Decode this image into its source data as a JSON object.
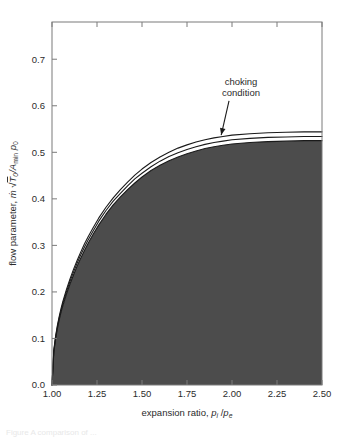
{
  "figure": {
    "background_color": "#ffffff",
    "frame_color": "#7a7a7a",
    "curve_color": "#1a1a1a",
    "fill_color": "#4c4c4c",
    "text_color": "#2b2b2b",
    "partial_caption": "Figure  A  comparison of ..."
  },
  "chart_data": {
    "type": "area",
    "title": "",
    "xlabel_parts": {
      "lead": "expansion ratio, ",
      "num_symbol": "p",
      "num_sub": "i",
      "slash": " /",
      "den_symbol": "p",
      "den_sub": "e"
    },
    "ylabel_parts": {
      "lead": "flow parameter, ",
      "mdot": "ṁ",
      "radical": "√",
      "t_symbol": "T",
      "t_sub": "0",
      "divider": "/A",
      "a_sub": "min",
      "p_symbol": "p",
      "p_sub": "0"
    },
    "xlabel": "expansion ratio, p_i / p_e",
    "ylabel": "flow parameter, ṁ √T_0 / A_min p_0",
    "xlim": [
      1.0,
      2.5
    ],
    "ylim": [
      0.0,
      0.78
    ],
    "xticks": [
      1.0,
      1.25,
      1.5,
      1.75,
      2.0,
      2.25,
      2.5
    ],
    "xtick_labels": [
      "1.00",
      "1.25",
      "1.50",
      "1.75",
      "2.00",
      "2.25",
      "2.50"
    ],
    "yticks": [
      0.0,
      0.1,
      0.2,
      0.3,
      0.4,
      0.5,
      0.6,
      0.7
    ],
    "ytick_labels": [
      "0.0",
      "0.1",
      "0.2",
      "0.3",
      "0.4",
      "0.5",
      "0.6",
      "0.7"
    ],
    "grid": false,
    "legend": null,
    "annotations": [
      {
        "text_line1": "choking",
        "text_line2": "condition",
        "text": "choking condition",
        "x_text": 2.05,
        "y_text": 0.645,
        "x_point": 1.94,
        "y_point": 0.537,
        "arrow": true
      }
    ],
    "series": [
      {
        "name": "upper choking curve",
        "shaded": false,
        "points": [
          [
            1.0,
            0.0
          ],
          [
            1.01,
            0.075
          ],
          [
            1.02,
            0.105
          ],
          [
            1.03,
            0.128
          ],
          [
            1.04,
            0.147
          ],
          [
            1.05,
            0.164
          ],
          [
            1.06,
            0.179
          ],
          [
            1.08,
            0.205
          ],
          [
            1.1,
            0.228
          ],
          [
            1.12,
            0.249
          ],
          [
            1.14,
            0.268
          ],
          [
            1.16,
            0.286
          ],
          [
            1.18,
            0.303
          ],
          [
            1.2,
            0.318
          ],
          [
            1.23,
            0.339
          ],
          [
            1.26,
            0.359
          ],
          [
            1.3,
            0.382
          ],
          [
            1.34,
            0.402
          ],
          [
            1.38,
            0.42
          ],
          [
            1.42,
            0.436
          ],
          [
            1.46,
            0.451
          ],
          [
            1.5,
            0.464
          ],
          [
            1.55,
            0.478
          ],
          [
            1.6,
            0.49
          ],
          [
            1.65,
            0.5
          ],
          [
            1.7,
            0.509
          ],
          [
            1.75,
            0.516
          ],
          [
            1.8,
            0.522
          ],
          [
            1.85,
            0.527
          ],
          [
            1.9,
            0.531
          ],
          [
            1.95,
            0.534
          ],
          [
            2.0,
            0.537
          ],
          [
            2.1,
            0.54
          ],
          [
            2.2,
            0.542
          ],
          [
            2.3,
            0.543
          ],
          [
            2.4,
            0.544
          ],
          [
            2.5,
            0.544
          ]
        ]
      },
      {
        "name": "middle curve",
        "shaded": false,
        "points": [
          [
            1.0,
            0.0
          ],
          [
            1.01,
            0.073
          ],
          [
            1.02,
            0.102
          ],
          [
            1.03,
            0.125
          ],
          [
            1.04,
            0.144
          ],
          [
            1.05,
            0.16
          ],
          [
            1.06,
            0.175
          ],
          [
            1.08,
            0.2
          ],
          [
            1.1,
            0.223
          ],
          [
            1.12,
            0.243
          ],
          [
            1.14,
            0.262
          ],
          [
            1.16,
            0.28
          ],
          [
            1.18,
            0.296
          ],
          [
            1.2,
            0.311
          ],
          [
            1.23,
            0.332
          ],
          [
            1.26,
            0.352
          ],
          [
            1.3,
            0.375
          ],
          [
            1.34,
            0.395
          ],
          [
            1.38,
            0.412
          ],
          [
            1.42,
            0.428
          ],
          [
            1.46,
            0.443
          ],
          [
            1.5,
            0.455
          ],
          [
            1.55,
            0.469
          ],
          [
            1.6,
            0.481
          ],
          [
            1.65,
            0.491
          ],
          [
            1.7,
            0.499
          ],
          [
            1.75,
            0.506
          ],
          [
            1.8,
            0.512
          ],
          [
            1.85,
            0.517
          ],
          [
            1.9,
            0.521
          ],
          [
            1.95,
            0.524
          ],
          [
            2.0,
            0.527
          ],
          [
            2.1,
            0.53
          ],
          [
            2.2,
            0.532
          ],
          [
            2.3,
            0.533
          ],
          [
            2.4,
            0.534
          ],
          [
            2.5,
            0.534
          ]
        ]
      },
      {
        "name": "lower choking curve (boundary of shaded region)",
        "shaded": true,
        "points": [
          [
            1.0,
            0.0
          ],
          [
            1.01,
            0.07
          ],
          [
            1.02,
            0.099
          ],
          [
            1.03,
            0.121
          ],
          [
            1.04,
            0.14
          ],
          [
            1.05,
            0.156
          ],
          [
            1.06,
            0.17
          ],
          [
            1.08,
            0.195
          ],
          [
            1.1,
            0.217
          ],
          [
            1.12,
            0.237
          ],
          [
            1.14,
            0.256
          ],
          [
            1.16,
            0.273
          ],
          [
            1.18,
            0.289
          ],
          [
            1.2,
            0.304
          ],
          [
            1.23,
            0.325
          ],
          [
            1.26,
            0.344
          ],
          [
            1.3,
            0.367
          ],
          [
            1.34,
            0.387
          ],
          [
            1.38,
            0.404
          ],
          [
            1.42,
            0.42
          ],
          [
            1.46,
            0.434
          ],
          [
            1.5,
            0.447
          ],
          [
            1.55,
            0.461
          ],
          [
            1.6,
            0.472
          ],
          [
            1.65,
            0.482
          ],
          [
            1.7,
            0.49
          ],
          [
            1.75,
            0.497
          ],
          [
            1.8,
            0.503
          ],
          [
            1.85,
            0.508
          ],
          [
            1.9,
            0.512
          ],
          [
            1.95,
            0.515
          ],
          [
            2.0,
            0.518
          ],
          [
            2.1,
            0.521
          ],
          [
            2.2,
            0.523
          ],
          [
            2.3,
            0.524
          ],
          [
            2.4,
            0.525
          ],
          [
            2.5,
            0.525
          ]
        ]
      }
    ]
  }
}
